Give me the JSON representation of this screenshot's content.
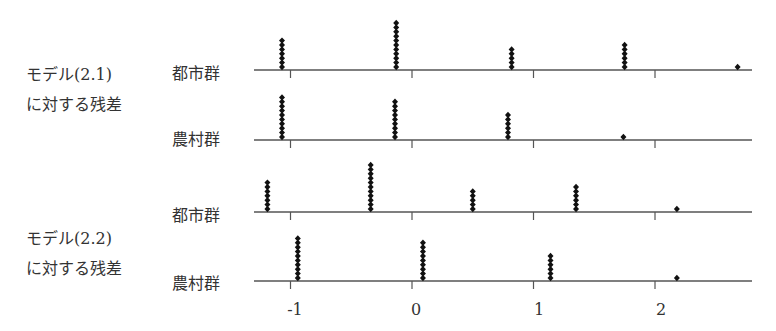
{
  "chart_data": {
    "type": "scatter",
    "subtype": "stacked-dot-plot",
    "title": "",
    "xlabel": "",
    "ylabel": "",
    "xlim": [
      -1.3,
      2.75
    ],
    "x_ticks": [
      -1,
      0,
      1,
      2
    ],
    "x_tick_labels": [
      "-1",
      "0",
      "1",
      "2"
    ],
    "grid": false,
    "legend": null,
    "panels": [
      {
        "model": "モデル(2.1)",
        "caption": "に対する残差",
        "series": [
          {
            "name": "都市群",
            "x": [
              -1.07,
              -0.13,
              0.82,
              1.75,
              2.68
            ],
            "counts": [
              7,
              11,
              5,
              6,
              1
            ]
          },
          {
            "name": "農村群",
            "x": [
              -1.07,
              -0.14,
              0.79,
              1.74
            ],
            "counts": [
              10,
              9,
              6,
              1
            ]
          }
        ]
      },
      {
        "model": "モデル(2.2)",
        "caption": "に対する残差",
        "series": [
          {
            "name": "都市群",
            "x": [
              -1.19,
              -0.34,
              0.5,
              1.35,
              2.18
            ],
            "counts": [
              7,
              11,
              5,
              6,
              1
            ]
          },
          {
            "name": "農村群",
            "x": [
              -0.94,
              0.09,
              1.14,
              2.18
            ],
            "counts": [
              10,
              9,
              6,
              1
            ]
          }
        ]
      }
    ]
  },
  "labels": {
    "model21_line1": "モデル(2.1)",
    "model21_line2": "に対する残差",
    "model22_line1": "モデル(2.2)",
    "model22_line2": "に対する残差",
    "urban": "都市群",
    "rural": "農村群",
    "tick_m1": "-1",
    "tick_0": "0",
    "tick_1": "1",
    "tick_2": "2"
  },
  "colors": {
    "axis": "#555555",
    "dot": "#111111"
  }
}
